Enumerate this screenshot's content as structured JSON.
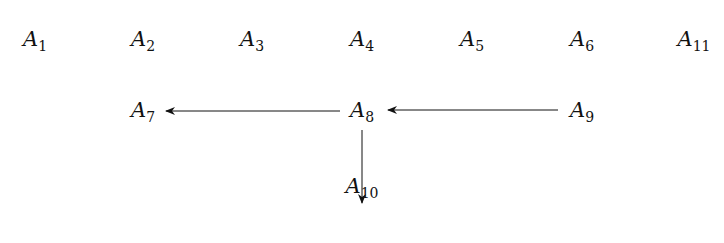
{
  "nodes": [
    {
      "id": "A1",
      "base": "A",
      "sub": "1",
      "x": 35,
      "y": 40
    },
    {
      "id": "A2",
      "base": "A",
      "sub": "2",
      "x": 143,
      "y": 40
    },
    {
      "id": "A3",
      "base": "A",
      "sub": "3",
      "x": 252,
      "y": 40
    },
    {
      "id": "A4",
      "base": "A",
      "sub": "4",
      "x": 362,
      "y": 40
    },
    {
      "id": "A5",
      "base": "A",
      "sub": "5",
      "x": 472,
      "y": 40
    },
    {
      "id": "A6",
      "base": "A",
      "sub": "6",
      "x": 582,
      "y": 40
    },
    {
      "id": "A11",
      "base": "A",
      "sub": "11",
      "x": 694,
      "y": 40
    },
    {
      "id": "A7",
      "base": "A",
      "sub": "7",
      "x": 143,
      "y": 111
    },
    {
      "id": "A8",
      "base": "A",
      "sub": "8",
      "x": 362,
      "y": 111
    },
    {
      "id": "A9",
      "base": "A",
      "sub": "9",
      "x": 582,
      "y": 111
    },
    {
      "id": "A10",
      "base": "A",
      "sub": "10",
      "x": 362,
      "y": 187
    }
  ],
  "edges": [
    {
      "from": "A8",
      "to": "A7"
    },
    {
      "from": "A9",
      "to": "A8"
    },
    {
      "from": "A8",
      "to": "A10"
    }
  ]
}
